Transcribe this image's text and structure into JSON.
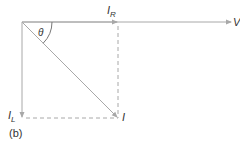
{
  "diagram": {
    "type": "phasor-diagram",
    "colors": {
      "line": "#a8a8a8",
      "text": "#333333"
    },
    "labels": {
      "voltage": "V",
      "resistive_current": "I",
      "resistive_sub": "R",
      "inductive_current": "I",
      "inductive_sub": "L",
      "total_current": "I",
      "angle": "θ",
      "panel": "(b)"
    },
    "vectors": [
      {
        "name": "V",
        "from": [
          22,
          22
        ],
        "to": [
          232,
          22
        ],
        "style": "solid"
      },
      {
        "name": "I_R",
        "from": [
          22,
          22
        ],
        "to": [
          118,
          22
        ],
        "style": "solid"
      },
      {
        "name": "I_L",
        "from": [
          22,
          22
        ],
        "to": [
          22,
          118
        ],
        "style": "solid"
      },
      {
        "name": "I",
        "from": [
          22,
          22
        ],
        "to": [
          118,
          118
        ],
        "style": "solid"
      }
    ],
    "construction_lines": [
      {
        "from": [
          118,
          22
        ],
        "to": [
          118,
          118
        ],
        "style": "dashed"
      },
      {
        "from": [
          22,
          118
        ],
        "to": [
          118,
          118
        ],
        "style": "dashed"
      }
    ]
  }
}
